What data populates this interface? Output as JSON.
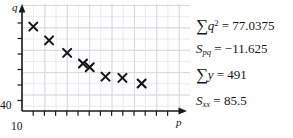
{
  "chart_data": {
    "type": "scatter",
    "title": "",
    "xlabel": "p",
    "ylabel": "q",
    "x_axis_start_label": "10",
    "y_axis_start_label": "40",
    "grid": true,
    "legend": "none",
    "xlim": [
      10,
      24
    ],
    "ylim": [
      40,
      56
    ],
    "points": [
      {
        "x": 11,
        "y": 53.5
      },
      {
        "x": 12.4,
        "y": 51.3
      },
      {
        "x": 14.0,
        "y": 49.3
      },
      {
        "x": 15.4,
        "y": 47.6
      },
      {
        "x": 16.0,
        "y": 47.0
      },
      {
        "x": 17.4,
        "y": 45.5
      },
      {
        "x": 18.9,
        "y": 45.3
      },
      {
        "x": 20.6,
        "y": 44.4
      }
    ],
    "marker": "x"
  },
  "chart": {
    "y_axis_label": "q",
    "x_axis_label": "p",
    "y_origin_tick": "40",
    "x_origin_tick": "10"
  },
  "stats": {
    "lines": [
      {
        "id": "sum-q-squared",
        "symbol": "∑",
        "variable": "q",
        "superscript": "2",
        "subscript": "",
        "equals": "=",
        "value": "77.0375",
        "plain": "∑q² = 77.0375"
      },
      {
        "id": "s-pq",
        "symbol": "S",
        "variable": "",
        "superscript": "",
        "subscript": "pq",
        "equals": "=",
        "value": "−11.625",
        "plain": "Sₚ₌ = −11.625"
      },
      {
        "id": "sum-y",
        "symbol": "∑",
        "variable": "y",
        "superscript": "",
        "subscript": "",
        "equals": "=",
        "value": "491",
        "plain": "∑y = 491"
      },
      {
        "id": "s-xx",
        "symbol": "S",
        "variable": "",
        "superscript": "",
        "subscript": "xx",
        "equals": "=",
        "value": "85.5",
        "plain": "Sₓₓ = 85.5"
      }
    ]
  },
  "colors": {
    "ink": "#151515",
    "grid_minor": "#e9e9ef",
    "grid_major": "#d8d8e2",
    "axis": "#1a1a1a"
  }
}
